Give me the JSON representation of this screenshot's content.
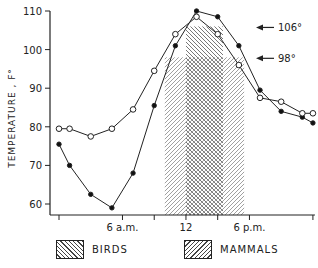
{
  "chart_data": {
    "type": "line",
    "title": "",
    "xlabel": "",
    "ylabel": "TEMPERATURE , F°",
    "ylim": [
      58,
      111
    ],
    "yticks": [
      60,
      70,
      80,
      90,
      100,
      110
    ],
    "xlim": [
      0,
      24
    ],
    "xticks": [
      {
        "hour": 0,
        "label": ""
      },
      {
        "hour": 6,
        "label": "6 a.m."
      },
      {
        "hour": 9,
        "label": ""
      },
      {
        "hour": 12,
        "label": "12"
      },
      {
        "hour": 15,
        "label": ""
      },
      {
        "hour": 18,
        "label": "6 p.m."
      },
      {
        "hour": 24,
        "label": ""
      }
    ],
    "grid": false,
    "x": [
      0,
      1,
      3,
      5,
      7,
      9,
      11,
      13,
      15,
      17,
      19,
      21,
      23,
      24
    ],
    "series": [
      {
        "name": "filled circles",
        "marker": "filled-circle",
        "values": [
          75.5,
          70,
          62.5,
          59,
          68,
          85.5,
          101,
          110,
          108.5,
          101,
          89.5,
          84,
          82.5,
          81
        ]
      },
      {
        "name": "open circles",
        "marker": "open-circle",
        "values": [
          79.5,
          79.5,
          77.5,
          79.5,
          84.5,
          94.5,
          104,
          108.5,
          104,
          96,
          87.5,
          86.5,
          83.5,
          83.5
        ]
      }
    ],
    "shaded_regions": [
      {
        "name": "BIRDS",
        "pattern": "backslash-hatch",
        "x_start": 12,
        "x_end": 15.5,
        "y_top": 106
      },
      {
        "name": "MAMMALS",
        "pattern": "slash-hatch",
        "x_start": 10,
        "x_end": 17.5,
        "y_top": 98
      }
    ],
    "annotations": [
      {
        "text": "106°",
        "y": 106,
        "arrow": "left"
      },
      {
        "text": "98°",
        "y": 98,
        "arrow": "left"
      }
    ],
    "legend": {
      "position": "bottom",
      "entries": [
        {
          "label": "BIRDS",
          "pattern": "backslash-hatch"
        },
        {
          "label": "MAMMALS",
          "pattern": "slash-hatch"
        }
      ]
    }
  },
  "labels": {
    "y_axis": "TEMPERATURE , F°",
    "ann_106": "106°",
    "ann_98": "98°",
    "legend_birds": "BIRDS",
    "legend_mammals": "MAMMALS"
  }
}
